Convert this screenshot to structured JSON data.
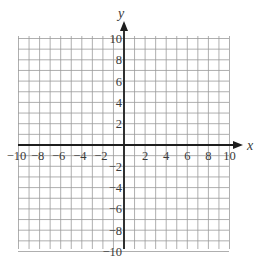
{
  "figure": {
    "type": "coordinate-grid",
    "x_axis_label": "x",
    "y_axis_label": "y",
    "x_range": [
      -10,
      10
    ],
    "y_range": [
      -10,
      10
    ],
    "grid_step": 1,
    "tick_step": 2,
    "x_tick_labels": [
      "−10",
      "−8",
      "−6",
      "−4",
      "−2",
      "2",
      "4",
      "6",
      "8",
      "10"
    ],
    "y_tick_labels": [
      "10",
      "8",
      "6",
      "4",
      "2",
      "−2",
      "−4",
      "−6",
      "−8",
      "−10"
    ],
    "colors": {
      "grid": "#9a9a9a",
      "axes": "#1e1e1e",
      "text": "#3a3a3a",
      "background": "#ffffff"
    }
  }
}
